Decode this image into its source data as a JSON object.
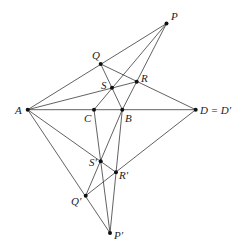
{
  "diagram": {
    "type": "projective-geometry",
    "points": [
      {
        "id": "P",
        "label": "P",
        "x": 166.5,
        "y": 23.5,
        "lx": 171,
        "ly": 20
      },
      {
        "id": "Q",
        "label": "Q",
        "x": 100.7,
        "y": 64,
        "lx": 92,
        "ly": 59
      },
      {
        "id": "R",
        "label": "R",
        "x": 136.7,
        "y": 81.7,
        "lx": 141,
        "ly": 82
      },
      {
        "id": "S",
        "label": "S",
        "x": 112,
        "y": 87.7,
        "lx": 101,
        "ly": 89
      },
      {
        "id": "A",
        "label": "A",
        "x": 27.7,
        "y": 109.7,
        "lx": 15,
        "ly": 114
      },
      {
        "id": "C",
        "label": "C",
        "x": 94,
        "y": 109.7,
        "lx": 84,
        "ly": 122
      },
      {
        "id": "B",
        "label": "B",
        "x": 122.3,
        "y": 109.7,
        "lx": 125,
        "ly": 122
      },
      {
        "id": "D",
        "label": "D = D′",
        "x": 195.7,
        "y": 109.7,
        "lx": 200,
        "ly": 114
      },
      {
        "id": "S2",
        "label": "S′",
        "x": 100.7,
        "y": 161.3,
        "lx": 89,
        "ly": 166
      },
      {
        "id": "R2",
        "label": "R′",
        "x": 116,
        "y": 172.3,
        "lx": 119,
        "ly": 179
      },
      {
        "id": "Q2",
        "label": "Q′",
        "x": 85.7,
        "y": 195.7,
        "lx": 71,
        "ly": 205
      },
      {
        "id": "P2",
        "label": "P′",
        "x": 110,
        "y": 233,
        "lx": 114,
        "ly": 239
      }
    ],
    "segments": [
      [
        "A",
        "P"
      ],
      [
        "P",
        "C"
      ],
      [
        "P",
        "B"
      ],
      [
        "A",
        "D"
      ],
      [
        "Q",
        "D"
      ],
      [
        "Q",
        "B"
      ],
      [
        "A",
        "R"
      ],
      [
        "A",
        "P2"
      ],
      [
        "A",
        "R2"
      ],
      [
        "D",
        "Q2"
      ],
      [
        "C",
        "P2"
      ],
      [
        "B",
        "P2"
      ],
      [
        "Q2",
        "B"
      ]
    ]
  }
}
